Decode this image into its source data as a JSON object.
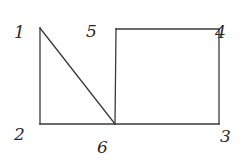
{
  "diagram": {
    "type": "graph",
    "stroke_color": "#3a3a3a",
    "label_color": "#2a2a2a",
    "nodes": [
      {
        "id": "1",
        "label": "1",
        "x": 40,
        "y": 28,
        "label_x": 14,
        "label_y": 38
      },
      {
        "id": "2",
        "label": "2",
        "x": 40,
        "y": 124,
        "label_x": 14,
        "label_y": 140
      },
      {
        "id": "3",
        "label": "3",
        "x": 219,
        "y": 124,
        "label_x": 220,
        "label_y": 142
      },
      {
        "id": "4",
        "label": "4",
        "x": 219,
        "y": 29,
        "label_x": 215,
        "label_y": 38
      },
      {
        "id": "5",
        "label": "5",
        "x": 116,
        "y": 29,
        "label_x": 86,
        "label_y": 37
      },
      {
        "id": "6",
        "label": "6",
        "x": 115,
        "y": 124,
        "label_x": 97,
        "label_y": 153
      }
    ],
    "edges": [
      {
        "from": "1",
        "to": "2"
      },
      {
        "from": "2",
        "to": "6"
      },
      {
        "from": "1",
        "to": "6"
      },
      {
        "from": "5",
        "to": "4"
      },
      {
        "from": "4",
        "to": "3"
      },
      {
        "from": "3",
        "to": "6"
      },
      {
        "from": "5",
        "to": "6"
      }
    ]
  }
}
